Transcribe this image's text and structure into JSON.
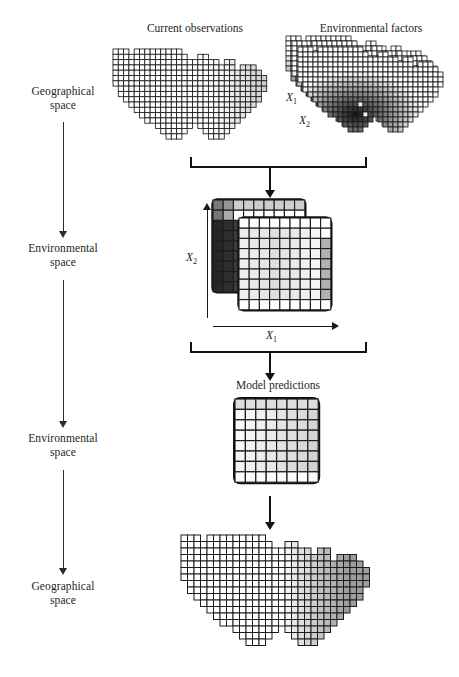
{
  "figure": {
    "kind": "conceptual-flow-diagram",
    "topic": "species distribution model: geographical to environmental space and back"
  },
  "panel_titles": {
    "current_observations": "Current observations",
    "environmental_factors": "Environmental factors",
    "model_predictions": "Model predictions"
  },
  "flow_labels": [
    {
      "id": "step1",
      "line1": "Geographical",
      "line2": "space"
    },
    {
      "id": "step2",
      "line1": "Environmental",
      "line2": "space"
    },
    {
      "id": "step3",
      "line1": "Environmental",
      "line2": "space"
    },
    {
      "id": "step4",
      "line1": "Geographical",
      "line2": "space"
    }
  ],
  "axis_labels": {
    "env_map_x1": "X",
    "env_map_x1_sub": "1",
    "env_map_x2": "X",
    "env_map_x2_sub": "2",
    "env_space_x1": "X",
    "env_space_x1_sub": "1",
    "env_space_x2": "X",
    "env_space_x2_sub": "2"
  },
  "colors": {
    "ink": "#1a1a1a",
    "line": "#1c1c1c",
    "arrow": "#121212",
    "cell_white": "#ffffff",
    "cell_light": "#e8e8e8",
    "cell_mid": "#b4b4b4",
    "cell_dark": "#4a4a4a",
    "cell_black": "#111111"
  },
  "chart_data": {
    "type": "heatmap",
    "panels": [
      {
        "name": "current_observations",
        "space": "geographical",
        "grid": "US-shaped raster, cell 6px",
        "fill": "mostly white with light grey gradient toward the east",
        "note": "presence/absence observation grid"
      },
      {
        "name": "environmental_factors",
        "space": "geographical",
        "grid": "three offset US-shaped rasters stacked",
        "fill": "dark to black cells concentrated in south-west / south-east",
        "axes": [
          "X1",
          "X2"
        ],
        "note": "multiple environmental predictor layers"
      },
      {
        "name": "environmental_space",
        "space": "environmental",
        "grid": "two offset 9x9 matrices",
        "axes": {
          "x": "X1",
          "y": "X2"
        },
        "fill": "back layer dark on left column, front layer light grey with grey right column"
      },
      {
        "name": "model_predictions",
        "space": "environmental",
        "grid": "8x8 matrix",
        "fill": "light grey gradient increasing left to right"
      },
      {
        "name": "projected_distribution",
        "space": "geographical",
        "grid": "US-shaped raster, cell 6px",
        "fill": "white in the west, medium grey across the east"
      }
    ]
  }
}
